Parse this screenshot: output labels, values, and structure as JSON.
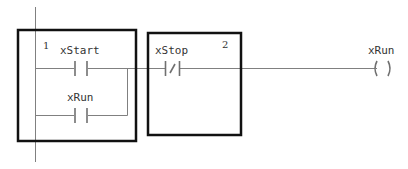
{
  "diagram": {
    "type": "ladder-logic",
    "rung": {
      "contacts": [
        {
          "name": "xStart",
          "kind": "normally-open",
          "branch": "main"
        },
        {
          "name": "xRun",
          "kind": "normally-open",
          "branch": "parallel"
        },
        {
          "name": "xStop",
          "kind": "normally-closed",
          "branch": "main"
        }
      ],
      "coil": {
        "name": "xRun",
        "kind": "output-coil"
      }
    },
    "highlight_boxes": [
      {
        "number": "1",
        "contains": [
          "xStart",
          "xRun"
        ]
      },
      {
        "number": "2",
        "contains": [
          "xStop"
        ]
      }
    ],
    "colors": {
      "wire": "#808080",
      "box": "#111111",
      "background": "#ffffff"
    }
  },
  "labels": {
    "box1_number": "1",
    "box2_number": "2",
    "contact_xstart": "xStart",
    "contact_xrun": "xRun",
    "contact_xstop": "xStop",
    "coil_xrun": "xRun"
  }
}
